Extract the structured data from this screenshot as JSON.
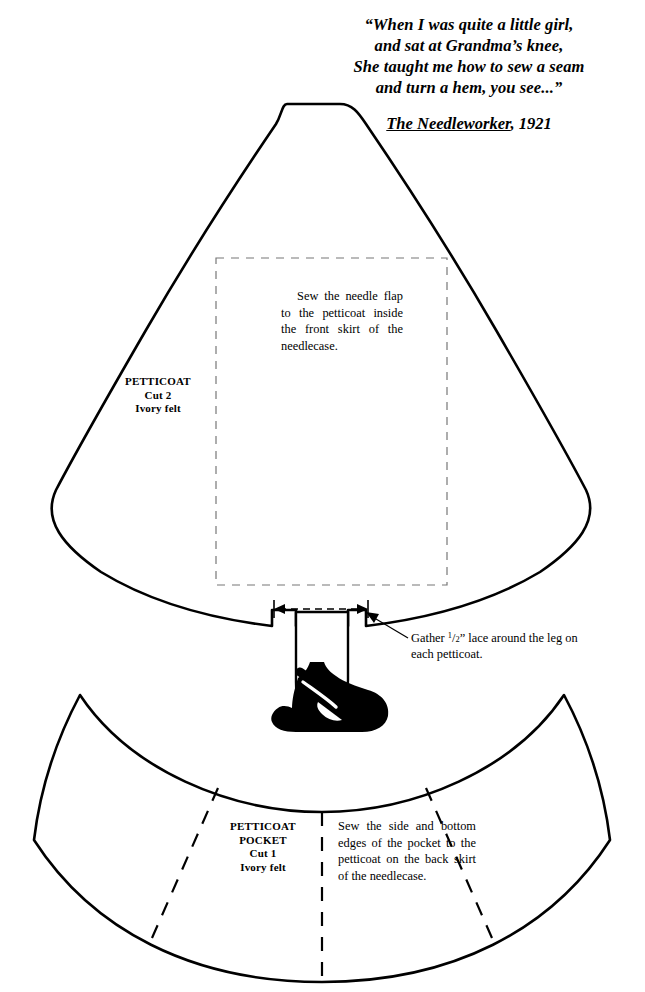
{
  "page": {
    "background": "#ffffff",
    "ink": "#000000",
    "width": 645,
    "height": 992
  },
  "quote": {
    "lines": [
      "“When I was quite a little girl,",
      "and sat at Grandma’s knee,",
      "She taught me how to sew a seam",
      "and turn a hem, you see...”"
    ],
    "attribution_title": "The Needleworker",
    "attribution_year": ", 1921"
  },
  "petticoat": {
    "label_name": "PETTICOAT",
    "label_cut": "Cut 2",
    "label_material": "Ivory felt",
    "flap_instruction": "Sew the needle flap to the petticoat inside the front skirt of the needlecase.",
    "lace_callout_prefix": "Gather ",
    "lace_callout_fraction_numerator": "1",
    "lace_callout_fraction_denominator": "2",
    "lace_callout_suffix": "” lace around the leg on each petticoat."
  },
  "pocket": {
    "label_name": "PETTICOAT",
    "label_name2": "POCKET",
    "label_cut": "Cut 1",
    "label_material": "Ivory felt",
    "instruction": "Sew the side and bottom edges of the pocket to the petticoat on the back skirt of the needlecase."
  },
  "shoe": {
    "fill": "#000000",
    "description": "mary-jane-shoe"
  }
}
